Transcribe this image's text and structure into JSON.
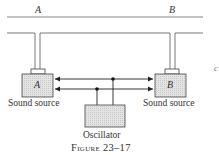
{
  "diagram": {
    "top_line_labels": {
      "left": "A",
      "right": "B"
    },
    "sources": [
      {
        "box_label": "A",
        "caption": "Sound source"
      },
      {
        "box_label": "B",
        "caption": "Sound source"
      }
    ],
    "oscillator": {
      "caption": "Oscillator"
    },
    "figure_caption": "Figure 23–17",
    "edge_clipped_char": "c",
    "colors": {
      "line": "#555555",
      "box_fill": "#dcdcdc",
      "box_stroke": "#444444",
      "text": "#333333"
    }
  }
}
